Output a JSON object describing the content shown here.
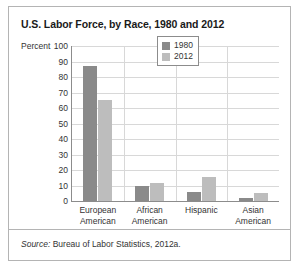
{
  "figure": {
    "title": "U.S. Labor Force, by Race, 1980 and 2012",
    "source_prefix": "Source:",
    "source_text": " Bureau of Labor Statistics, 2012a."
  },
  "colors": {
    "series_1980": "#8a8a8a",
    "series_2012": "#bdbdbd",
    "axis": "#8c8c8c",
    "grid": "#d8d8d8",
    "border": "#b4b4b4",
    "text": "#333333"
  },
  "chart_data": {
    "type": "bar",
    "title": "U.S. Labor Force, by Race, 1980 and 2012",
    "xlabel": "",
    "ylabel": "Percent",
    "ylim": [
      0,
      100
    ],
    "yticks": [
      0,
      10,
      20,
      30,
      40,
      50,
      60,
      70,
      80,
      90,
      100
    ],
    "grid": true,
    "legend_position": "top-right",
    "categories": [
      "European\nAmerican",
      "African\nAmerican",
      "Hispanic",
      "Asian\nAmerican"
    ],
    "category_lines": [
      [
        "European",
        "American"
      ],
      [
        "African",
        "American"
      ],
      [
        "Hispanic",
        ""
      ],
      [
        "Asian",
        "American"
      ]
    ],
    "series": [
      {
        "name": "1980",
        "values": [
          87,
          10,
          6,
          2
        ]
      },
      {
        "name": "2012",
        "values": [
          65,
          11.5,
          15.5,
          5
        ]
      }
    ]
  }
}
